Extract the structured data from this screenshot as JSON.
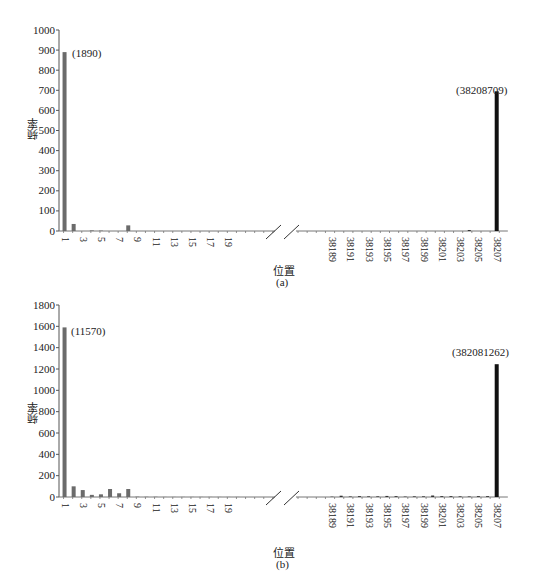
{
  "chart_data": [
    {
      "id": "a",
      "type": "bar",
      "caption": "(a)",
      "xlabel": "位置",
      "ylabel": "频率",
      "ylim": [
        0,
        1000
      ],
      "yticks": [
        0,
        100,
        200,
        300,
        400,
        500,
        600,
        700,
        800,
        900,
        1000
      ],
      "grid": false,
      "axis_break": true,
      "left_segment": {
        "tick_labels": [
          "1",
          "3",
          "5",
          "7",
          "9",
          "11",
          "13",
          "15",
          "17",
          "19"
        ],
        "x": [
          1,
          2,
          3,
          4,
          5,
          6,
          7,
          8,
          9,
          10,
          11,
          12,
          13,
          14,
          15,
          16,
          17,
          18,
          19,
          20
        ],
        "values": [
          890,
          35,
          0,
          3,
          2,
          0,
          0,
          28,
          0,
          0,
          0,
          0,
          0,
          0,
          0,
          0,
          0,
          0,
          0,
          0
        ]
      },
      "right_segment": {
        "tick_labels": [
          "38189",
          "38191",
          "38193",
          "38195",
          "38197",
          "38199",
          "38201",
          "38203",
          "38205",
          "38207"
        ],
        "x": [
          38189,
          38190,
          38191,
          38192,
          38193,
          38194,
          38195,
          38196,
          38197,
          38198,
          38199,
          38200,
          38201,
          38202,
          38203,
          38204,
          38205,
          38206,
          38207
        ],
        "values": [
          0,
          0,
          0,
          0,
          0,
          0,
          0,
          0,
          0,
          0,
          0,
          0,
          0,
          0,
          0,
          5,
          0,
          0,
          695
        ]
      },
      "annotations": [
        {
          "x": 1,
          "text": "(1890)"
        },
        {
          "x": 38207,
          "text": "(38208709)"
        }
      ]
    },
    {
      "id": "b",
      "type": "bar",
      "caption": "(b)",
      "xlabel": "位置",
      "ylabel": "频率",
      "ylim": [
        0,
        1800
      ],
      "yticks": [
        0,
        200,
        400,
        600,
        800,
        1000,
        1200,
        1400,
        1600,
        1800
      ],
      "grid": false,
      "axis_break": true,
      "left_segment": {
        "tick_labels": [
          "1",
          "3",
          "5",
          "7",
          "9",
          "11",
          "13",
          "15",
          "17",
          "19"
        ],
        "x": [
          1,
          2,
          3,
          4,
          5,
          6,
          7,
          8,
          9,
          10,
          11,
          12,
          13,
          14,
          15,
          16,
          17,
          18,
          19,
          20
        ],
        "values": [
          1590,
          100,
          65,
          20,
          25,
          75,
          35,
          75,
          3,
          2,
          2,
          1,
          1,
          1,
          1,
          1,
          1,
          1,
          1,
          1
        ]
      },
      "right_segment": {
        "tick_labels": [
          "38189",
          "38191",
          "38193",
          "38195",
          "38197",
          "38199",
          "38201",
          "38203",
          "38205",
          "38207"
        ],
        "x": [
          38189,
          38190,
          38191,
          38192,
          38193,
          38194,
          38195,
          38196,
          38197,
          38198,
          38199,
          38200,
          38201,
          38202,
          38203,
          38204,
          38205,
          38206,
          38207
        ],
        "values": [
          3,
          12,
          5,
          8,
          6,
          6,
          10,
          8,
          4,
          6,
          6,
          14,
          8,
          8,
          6,
          5,
          8,
          8,
          1245
        ]
      },
      "annotations": [
        {
          "x": 1,
          "text": "(11570)"
        },
        {
          "x": 38207,
          "text": "(382081262)"
        }
      ]
    }
  ]
}
